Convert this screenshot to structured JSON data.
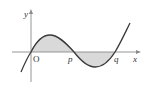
{
  "diagram": {
    "type": "function-graph",
    "axes": {
      "x_label": "x",
      "y_label": "y",
      "origin_label": "O"
    },
    "points": {
      "p_label": "p",
      "q_label": "q"
    },
    "colors": {
      "curve": "#3a3a3a",
      "axis": "#8a8a8a",
      "shade": "#d9d9d9",
      "text": "#333333"
    }
  }
}
